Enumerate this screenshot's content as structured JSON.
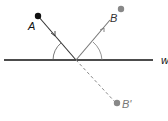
{
  "diagram": {
    "type": "reflection-geometry",
    "labels": {
      "point_a": "A",
      "point_b": "B",
      "point_b_reflected": "B'",
      "line": "w"
    },
    "colors": {
      "point_a": "#111111",
      "point_b": "#888888",
      "point_b_reflected": "#888888",
      "line": "#111111",
      "ray_a": "#333333",
      "ray_b": "#777777",
      "dashed": "#888888"
    },
    "points": {
      "A": [
        38,
        16
      ],
      "B": [
        121,
        9
      ],
      "B_reflected": [
        117,
        103
      ],
      "reflection_point": [
        76,
        60
      ]
    }
  }
}
